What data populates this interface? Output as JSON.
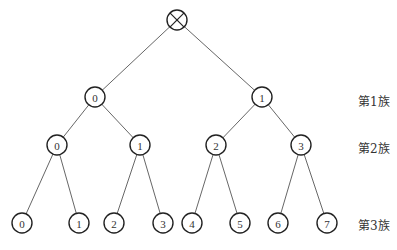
{
  "diagram": {
    "type": "binary-tree",
    "root": {
      "symbol": "⊗",
      "x": 177,
      "y": 20,
      "r": 10
    },
    "node_radius": 10,
    "levels": [
      {
        "label": "第1族",
        "label_x": 358,
        "label_y": 100,
        "nodes": [
          {
            "text": "0",
            "x": 95,
            "y": 97,
            "parent": "root"
          },
          {
            "text": "1",
            "x": 262,
            "y": 97,
            "parent": "root"
          }
        ]
      },
      {
        "label": "第2族",
        "label_x": 358,
        "label_y": 147,
        "nodes": [
          {
            "text": "0",
            "x": 57,
            "y": 145,
            "parent": 0
          },
          {
            "text": "1",
            "x": 140,
            "y": 145,
            "parent": 0
          },
          {
            "text": "2",
            "x": 216,
            "y": 145,
            "parent": 1
          },
          {
            "text": "3",
            "x": 301,
            "y": 145,
            "parent": 1
          }
        ]
      },
      {
        "label": "第3族",
        "label_x": 358,
        "label_y": 224,
        "nodes": [
          {
            "text": "0",
            "x": 22,
            "y": 223,
            "parent": 0
          },
          {
            "text": "1",
            "x": 79,
            "y": 223,
            "parent": 0
          },
          {
            "text": "2",
            "x": 114,
            "y": 223,
            "parent": 1
          },
          {
            "text": "3",
            "x": 163,
            "y": 223,
            "parent": 1
          },
          {
            "text": "4",
            "x": 192,
            "y": 223,
            "parent": 2
          },
          {
            "text": "5",
            "x": 240,
            "y": 223,
            "parent": 2
          },
          {
            "text": "6",
            "x": 278,
            "y": 223,
            "parent": 3
          },
          {
            "text": "7",
            "x": 327,
            "y": 223,
            "parent": 3
          }
        ]
      }
    ]
  }
}
